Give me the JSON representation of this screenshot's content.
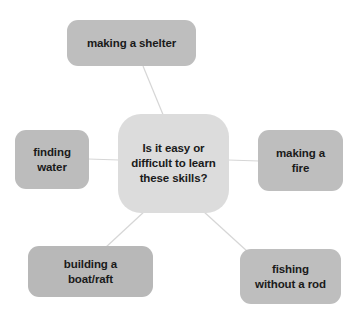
{
  "diagram": {
    "type": "mind-map",
    "layout": "radial",
    "background_color": "#ffffff",
    "center": {
      "id": "center",
      "label": "Is it easy or\ndifficult to learn\nthese skills?",
      "fill_color": "#dcdcdc",
      "text_color": "#1a1a1a",
      "shape": "rounded-rectangle",
      "x": 118,
      "y": 114,
      "width": 111,
      "height": 99
    },
    "branches": [
      {
        "id": "shelter",
        "label": "making a shelter",
        "fill_color": "#bebebe",
        "text_color": "#1a1a1a",
        "shape": "rounded-rectangle",
        "position": "top",
        "x": 67,
        "y": 20,
        "width": 129,
        "height": 46
      },
      {
        "id": "water",
        "label": "finding\nwater",
        "fill_color": "#bcbcbc",
        "text_color": "#1a1a1a",
        "shape": "rounded-rectangle",
        "position": "left",
        "x": 15,
        "y": 130,
        "width": 74,
        "height": 59
      },
      {
        "id": "fire",
        "label": "making a\nfire",
        "fill_color": "#bebebe",
        "text_color": "#1a1a1a",
        "shape": "rounded-rectangle",
        "position": "right",
        "x": 258,
        "y": 130,
        "width": 85,
        "height": 61
      },
      {
        "id": "boat",
        "label": "building a\nboat/raft",
        "fill_color": "#b8b8b8",
        "text_color": "#1a1a1a",
        "shape": "rounded-rectangle",
        "position": "bottom-left",
        "x": 28,
        "y": 246,
        "width": 125,
        "height": 51
      },
      {
        "id": "fishing",
        "label": "fishing\nwithout a rod",
        "fill_color": "#bebebe",
        "text_color": "#1a1a1a",
        "shape": "rounded-rectangle",
        "position": "bottom-right",
        "x": 240,
        "y": 249,
        "width": 101,
        "height": 55
      }
    ],
    "connectors": {
      "color": "#d6d6d6",
      "width": 1.2,
      "edges": [
        {
          "id": "center-shelter",
          "from": "center",
          "to": "shelter",
          "x1": 164,
          "y1": 117,
          "x2": 143,
          "y2": 66
        },
        {
          "id": "center-water",
          "from": "center",
          "to": "water",
          "x1": 119,
          "y1": 160,
          "x2": 88,
          "y2": 159
        },
        {
          "id": "center-fire",
          "from": "center",
          "to": "fire",
          "x1": 228,
          "y1": 160,
          "x2": 259,
          "y2": 161
        },
        {
          "id": "center-boat",
          "from": "center",
          "to": "boat",
          "x1": 146,
          "y1": 210,
          "x2": 105,
          "y2": 248
        },
        {
          "id": "center-fishing",
          "from": "center",
          "to": "fishing",
          "x1": 203,
          "y1": 211,
          "x2": 248,
          "y2": 252
        }
      ]
    }
  }
}
